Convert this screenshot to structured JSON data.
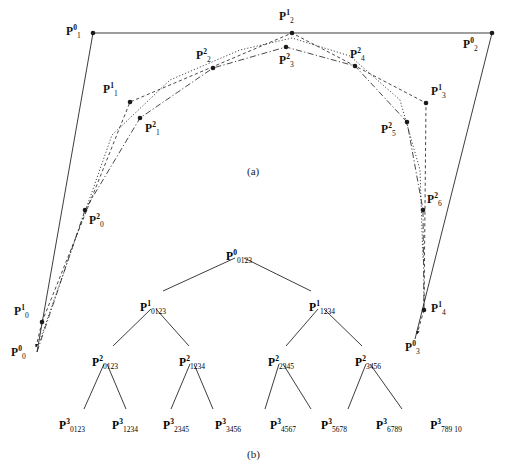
{
  "figure": {
    "width": 513,
    "height": 467,
    "background": "#ffffff",
    "ink": "#1a1a1a"
  },
  "panel_a": {
    "caption": "(a)",
    "caption_pos": {
      "x": 256,
      "y": 165
    },
    "points": [
      {
        "id": "P0_1",
        "label_html": "<b>P</b><sup>0</sup><sub>1</sub>",
        "x": 93,
        "y": 33,
        "lx": 66,
        "ly": 26,
        "dot": true
      },
      {
        "id": "P0_2",
        "label_html": "<b>P</b><sup>0</sup><sub>2</sub>",
        "x": 492,
        "y": 33,
        "lx": 463,
        "ly": 39,
        "dot": true
      },
      {
        "id": "P1_0",
        "label_html": "<b>P</b><sup>1</sup><sub>0</sub>",
        "x": 42,
        "y": 322,
        "lx": 14,
        "ly": 306,
        "dot": true
      },
      {
        "id": "P1_1",
        "label_html": "<b>P</b><sup>1</sup><sub>1</sub>",
        "x": 130,
        "y": 102,
        "lx": 103,
        "ly": 84,
        "dot": true
      },
      {
        "id": "P1_2",
        "label_html": "<b>P</b><sup>1</sup><sub>2</sub>",
        "x": 292,
        "y": 33,
        "lx": 279,
        "ly": 11,
        "dot": true
      },
      {
        "id": "P1_3",
        "label_html": "<b>P</b><sup>1</sup><sub>3</sub>",
        "x": 426,
        "y": 103,
        "lx": 431,
        "ly": 86,
        "dot": true
      },
      {
        "id": "P1_4",
        "label_html": "<b>P</b><sup>1</sup><sub>4</sub>",
        "x": 424,
        "y": 310,
        "lx": 431,
        "ly": 303,
        "dot": true
      },
      {
        "id": "P2_0",
        "label_html": "<b>P</b><sup>2</sup><sub>0</sub>",
        "x": 85,
        "y": 210,
        "lx": 89,
        "ly": 215,
        "dot": true
      },
      {
        "id": "P2_1",
        "label_html": "<b>P</b><sup>2</sup><sub>1</sub>",
        "x": 140,
        "y": 118,
        "lx": 145,
        "ly": 123,
        "dot": true
      },
      {
        "id": "P2_2",
        "label_html": "<b>P</b><sup>2</sup><sub>2</sub>",
        "x": 213,
        "y": 68,
        "lx": 196,
        "ly": 50,
        "dot": true
      },
      {
        "id": "P2_3",
        "label_html": "<b>P</b><sup>2</sup><sub>3</sub>",
        "x": 286,
        "y": 47,
        "lx": 279,
        "ly": 55,
        "dot": true
      },
      {
        "id": "P2_4",
        "label_html": "<b>P</b><sup>2</sup><sub>4</sub>",
        "x": 355,
        "y": 66,
        "lx": 350,
        "ly": 49,
        "dot": true
      },
      {
        "id": "P2_5",
        "label_html": "<b>P</b><sup>2</sup><sub>5</sub>",
        "x": 407,
        "y": 122,
        "lx": 381,
        "ly": 124,
        "dot": true
      },
      {
        "id": "P2_6",
        "label_html": "<b>P</b><sup>2</sup><sub>6</sub>",
        "x": 423,
        "y": 210,
        "lx": 427,
        "ly": 194,
        "dot": true
      },
      {
        "id": "P0_0",
        "label_html": "<b>P</b><sup>0</sup><sub>0</sub>",
        "x": 37,
        "y": 352,
        "lx": 11,
        "ly": 347,
        "dot": false
      },
      {
        "id": "P0_3",
        "label_html": "<b>P</b><sup>0</sup><sub>3</sub>",
        "x": 415,
        "y": 339,
        "lx": 405,
        "ly": 342,
        "dot": false
      }
    ],
    "polylines": [
      {
        "name": "control-polygon-level0",
        "style": "solid",
        "pts": "37,352 93,33 492,33 415,339"
      },
      {
        "name": "control-polygon-level1",
        "style": "dashed",
        "pts": "42,322 130,102 292,33 426,103 424,310"
      },
      {
        "name": "control-polygon-level2",
        "style": "dashdot",
        "pts": "37,352 85,210 140,118 213,68 286,47 355,66 407,122 423,210 424,310"
      },
      {
        "name": "refined-curve",
        "style": "dotted",
        "pts": "40,340 112,135 170,80 240,50 292,38 350,56 400,100 420,170 423,260"
      }
    ]
  },
  "panel_b": {
    "caption": "(b)",
    "caption_pos": {
      "x": 256,
      "y": 448
    },
    "nodes": [
      {
        "id": "root",
        "label_html": "<b>P</b><sup>0</sup><sub>0123</sub>",
        "x": 239,
        "y": 251,
        "level": 0
      },
      {
        "id": "l1a",
        "label_html": "<b>P</b><sup>1</sup><sub>0123</sub>",
        "x": 153,
        "y": 302,
        "level": 1
      },
      {
        "id": "l1b",
        "label_html": "<b>P</b><sup>1</sup><sub>1234</sub>",
        "x": 322,
        "y": 302,
        "level": 1
      },
      {
        "id": "l2a",
        "label_html": "<b>P</b><sup>2</sup><sub>0123</sub>",
        "x": 105,
        "y": 357,
        "level": 2
      },
      {
        "id": "l2b",
        "label_html": "<b>P</b><sup>2</sup><sub>1234</sub>",
        "x": 192,
        "y": 357,
        "level": 2
      },
      {
        "id": "l2c",
        "label_html": "<b>P</b><sup>2</sup><sub>2345</sub>",
        "x": 281,
        "y": 357,
        "level": 2
      },
      {
        "id": "l2d",
        "label_html": "<b>P</b><sup>2</sup><sub>3456</sub>",
        "x": 368,
        "y": 357,
        "level": 2
      },
      {
        "id": "l3a",
        "label_html": "<b>P</b><sup>3</sup><sub>0123</sub>",
        "x": 72,
        "y": 420,
        "level": 3
      },
      {
        "id": "l3b",
        "label_html": "<b>P</b><sup>3</sup><sub>1234</sub>",
        "x": 125,
        "y": 420,
        "level": 3
      },
      {
        "id": "l3c",
        "label_html": "<b>P</b><sup>3</sup><sub>2345</sub>",
        "x": 176,
        "y": 420,
        "level": 3
      },
      {
        "id": "l3d",
        "label_html": "<b>P</b><sup>3</sup><sub>3456</sub>",
        "x": 228,
        "y": 420,
        "level": 3
      },
      {
        "id": "l3e",
        "label_html": "<b>P</b><sup>3</sup><sub>4567</sub>",
        "x": 283,
        "y": 420,
        "level": 3
      },
      {
        "id": "l3f",
        "label_html": "<b>P</b><sup>3</sup><sub>5678</sub>",
        "x": 334,
        "y": 420,
        "level": 3
      },
      {
        "id": "l3g",
        "label_html": "<b>P</b><sup>3</sup><sub>6789</sub>",
        "x": 389,
        "y": 420,
        "level": 3
      },
      {
        "id": "l3h",
        "label_html": "<b>P</b><sup>3</sup><sub>789 10</sub>",
        "x": 446,
        "y": 420,
        "level": 3
      }
    ],
    "edges": [
      {
        "from": "root",
        "to": "l1a",
        "x1": 235,
        "y1": 258,
        "x2": 163,
        "y2": 291
      },
      {
        "from": "root",
        "to": "l1b",
        "x1": 244,
        "y1": 258,
        "x2": 311,
        "y2": 291
      },
      {
        "from": "l1a",
        "to": "l2a",
        "x1": 151,
        "y1": 309,
        "x2": 113,
        "y2": 346
      },
      {
        "from": "l1a",
        "to": "l2b",
        "x1": 156,
        "y1": 309,
        "x2": 189,
        "y2": 346
      },
      {
        "from": "l1b",
        "to": "l2c",
        "x1": 318,
        "y1": 309,
        "x2": 286,
        "y2": 346
      },
      {
        "from": "l1b",
        "to": "l2d",
        "x1": 324,
        "y1": 309,
        "x2": 362,
        "y2": 346
      },
      {
        "from": "l2a",
        "to": "l3a",
        "x1": 104,
        "y1": 364,
        "x2": 84,
        "y2": 409
      },
      {
        "from": "l2a",
        "to": "l3b",
        "x1": 107,
        "y1": 364,
        "x2": 126,
        "y2": 409
      },
      {
        "from": "l2b",
        "to": "l3c",
        "x1": 190,
        "y1": 364,
        "x2": 171,
        "y2": 409
      },
      {
        "from": "l2b",
        "to": "l3d",
        "x1": 194,
        "y1": 364,
        "x2": 213,
        "y2": 409
      },
      {
        "from": "l2c",
        "to": "l3e",
        "x1": 279,
        "y1": 364,
        "x2": 265,
        "y2": 409
      },
      {
        "from": "l2c",
        "to": "l3f",
        "x1": 283,
        "y1": 364,
        "x2": 311,
        "y2": 409
      },
      {
        "from": "l2d",
        "to": "l3g",
        "x1": 366,
        "y1": 364,
        "x2": 348,
        "y2": 409
      },
      {
        "from": "l2d",
        "to": "l3h",
        "x1": 370,
        "y1": 364,
        "x2": 402,
        "y2": 409
      }
    ]
  }
}
